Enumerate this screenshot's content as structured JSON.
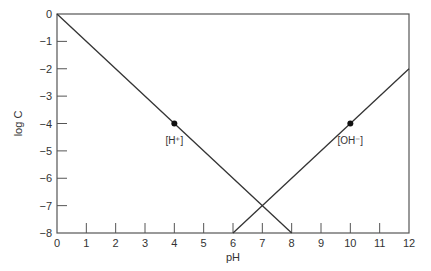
{
  "chart_data": {
    "type": "line",
    "title": "",
    "xlabel": "pH",
    "ylabel": "log C",
    "xlim": [
      0,
      12
    ],
    "ylim": [
      -8,
      0
    ],
    "grid": false,
    "x_ticks": [
      "0",
      "1",
      "2",
      "3",
      "4",
      "5",
      "6",
      "7",
      "8",
      "9",
      "10",
      "11",
      "12"
    ],
    "y_ticks": [
      "0",
      "−1",
      "−2",
      "−3",
      "−4",
      "−5",
      "−6",
      "−7",
      "−8"
    ],
    "series": [
      {
        "name": "[H+]",
        "label": "[H⁺]",
        "x": [
          0,
          8
        ],
        "y": [
          0,
          -8
        ],
        "color": "#333333"
      },
      {
        "name": "[OH-]",
        "label": "[OH⁻]",
        "x": [
          6,
          12
        ],
        "y": [
          -8,
          -2
        ],
        "color": "#333333"
      }
    ],
    "points": [
      {
        "series": "[H+]",
        "x": 4,
        "y": -4
      },
      {
        "series": "[OH-]",
        "x": 10,
        "y": -4
      }
    ],
    "annotations": [
      {
        "text": "[H⁺]",
        "x": 4,
        "y": -4.6
      },
      {
        "text": "[OH⁻]",
        "x": 10,
        "y": -4.6
      }
    ]
  }
}
